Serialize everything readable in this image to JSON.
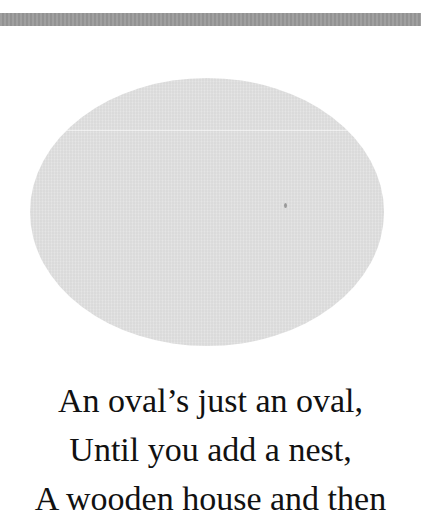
{
  "page": {
    "band_color": "#9a9a9a",
    "oval_color": "#e0e0e0",
    "text_color": "#111111"
  },
  "illustration": {
    "shape": "oval"
  },
  "poem": {
    "lines": [
      "An oval’s just an oval,",
      "Until you add a nest,",
      "A wooden house and then"
    ]
  }
}
